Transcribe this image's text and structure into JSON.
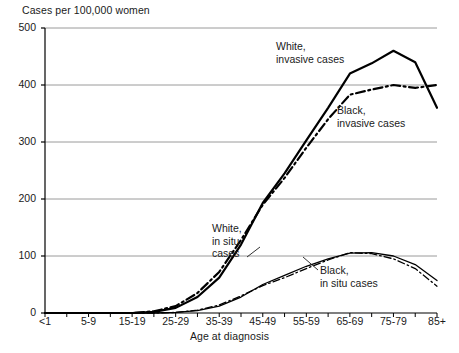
{
  "chart_data": {
    "type": "line",
    "title": "",
    "ylabel": "Cases per 100,000 women",
    "xlabel": "Age at diagnosis",
    "ylim": [
      0,
      500
    ],
    "yticks": [
      0,
      100,
      200,
      300,
      400,
      500
    ],
    "grid": true,
    "legend_position": "inline-annotations",
    "categories": [
      "<1",
      "1-4",
      "5-9",
      "10-14",
      "15-19",
      "20-24",
      "25-29",
      "30-34",
      "35-39",
      "40-44",
      "45-49",
      "50-54",
      "55-59",
      "60-64",
      "65-69",
      "70-74",
      "75-79",
      "80-84",
      "85+"
    ],
    "tick_labels": [
      "<1",
      "",
      "5-9",
      "",
      "15-19",
      "",
      "25-29",
      "",
      "35-39",
      "",
      "45-49",
      "",
      "55-59",
      "",
      "65-69",
      "",
      "75-79",
      "",
      "85+"
    ],
    "series": [
      {
        "name": "White, invasive cases",
        "style": "solid",
        "color": "#000000",
        "values": [
          0,
          0,
          0,
          0,
          0,
          2,
          9,
          28,
          62,
          120,
          193,
          245,
          303,
          360,
          420,
          438,
          460,
          440,
          360
        ]
      },
      {
        "name": "Black, invasive cases",
        "style": "dash-dot",
        "color": "#000000",
        "values": [
          0,
          0,
          0,
          0,
          0,
          3,
          12,
          35,
          72,
          128,
          190,
          237,
          290,
          340,
          383,
          392,
          400,
          395,
          400
        ]
      },
      {
        "name": "White, in situ cases",
        "style": "solid",
        "color": "#000000",
        "values": [
          0,
          0,
          0,
          0,
          0,
          0,
          1,
          4,
          12,
          28,
          50,
          66,
          82,
          95,
          105,
          106,
          100,
          85,
          57
        ]
      },
      {
        "name": "Black, in situ cases",
        "style": "dash-dot",
        "color": "#000000",
        "values": [
          0,
          0,
          0,
          0,
          0,
          0,
          1,
          5,
          14,
          30,
          48,
          62,
          78,
          93,
          106,
          104,
          95,
          78,
          47
        ]
      }
    ],
    "annotations": [
      {
        "id": "white-invasive",
        "line1": "White,",
        "line2": "invasive cases"
      },
      {
        "id": "black-invasive",
        "line1": "Black,",
        "line2": "invasive cases"
      },
      {
        "id": "white-insitu",
        "line1": "White,",
        "line2": "in situ",
        "line3": "cases"
      },
      {
        "id": "black-insitu",
        "line1": "Black,",
        "line2": "in situ cases"
      }
    ],
    "colors": {
      "axis": "#000000",
      "grid": "#9a9a9a",
      "series": "#000000",
      "text": "#1a1a1a"
    }
  }
}
